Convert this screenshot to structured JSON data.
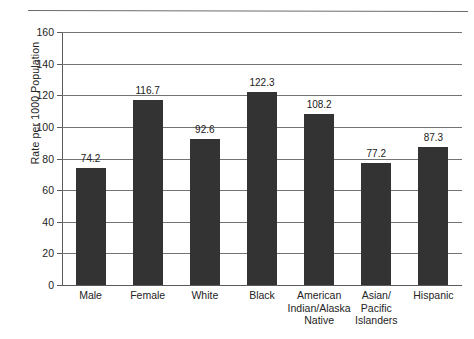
{
  "chart_data": {
    "type": "bar",
    "title": "",
    "xlabel": "",
    "ylabel": "Rate per 1000 Population",
    "ylim": [
      0,
      160
    ],
    "ytick_step": 20,
    "yticks": [
      0,
      20,
      40,
      60,
      80,
      100,
      120,
      140,
      160
    ],
    "grid": true,
    "legend": false,
    "bar_color": "#333333",
    "categories": [
      "Male",
      "Female",
      "White",
      "Black",
      "American\nIndian/Alaska\nNative",
      "Asian/\nPacific\nIslanders",
      "Hispanic"
    ],
    "values": [
      74.2,
      116.7,
      92.6,
      122.3,
      108.2,
      77.2,
      87.3
    ],
    "value_labels": [
      "74.2",
      "116.7",
      "92.6",
      "122.3",
      "108.2",
      "77.2",
      "87.3"
    ]
  }
}
